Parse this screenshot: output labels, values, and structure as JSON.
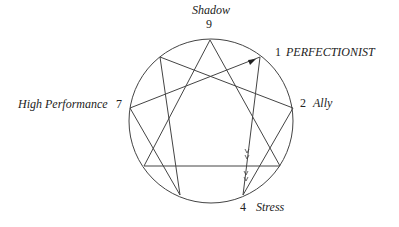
{
  "diagram": {
    "type": "enneagram",
    "points": {
      "9": {
        "number": "9",
        "label": "Shadow"
      },
      "1": {
        "number": "1",
        "label": "PERFECTIONIST"
      },
      "2": {
        "number": "2",
        "label": "Ally"
      },
      "7": {
        "number": "7",
        "label": "High Performance"
      },
      "4": {
        "number": "4",
        "label": "Stress"
      }
    },
    "arrows": [
      "7 → 1",
      "1 → 4"
    ],
    "line_color": "#333333"
  }
}
